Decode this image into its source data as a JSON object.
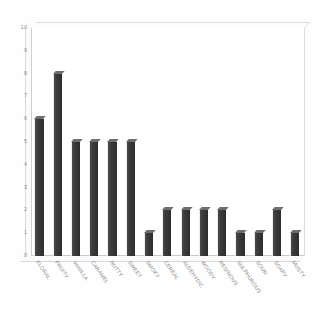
{
  "chart_data": {
    "type": "bar",
    "title": "",
    "subtitle": "",
    "xlabel": "",
    "ylabel": "",
    "ylim": [
      0,
      10
    ],
    "ytick_step": 1,
    "yticks": [
      10,
      9,
      8,
      7,
      6,
      5,
      4,
      3,
      2,
      1,
      0
    ],
    "grid": false,
    "legend": false,
    "legend_position": "none",
    "style": "3d-column",
    "categories": [
      "FLORAL",
      "FRUITY",
      "VANILLA",
      "CARAMEL",
      "NUTTY",
      "SWEET",
      "SMOKY",
      "CEREAL",
      "ALDEHYDIC",
      "WOODY",
      "RESINOUS",
      "SULPHUROUS",
      "SOUR",
      "SOAPY",
      "MUSTY"
    ],
    "values": [
      6,
      8,
      5,
      5,
      5,
      5,
      1,
      2,
      2,
      2,
      2,
      1,
      1,
      2,
      1
    ],
    "series": [
      {
        "name": "",
        "values": [
          6,
          8,
          5,
          5,
          5,
          5,
          1,
          2,
          2,
          2,
          2,
          1,
          1,
          2,
          1
        ]
      }
    ],
    "annotations": []
  },
  "colors": {
    "background": "#ffffff",
    "bar_fill": "#3b3b3b",
    "bar_top": "#6e6e6e",
    "bar_highlight": "#eeeeee",
    "axis_line": "#cfcfcf",
    "tick_text": "#8d8d8d",
    "label_text": "#8a8a8a"
  }
}
